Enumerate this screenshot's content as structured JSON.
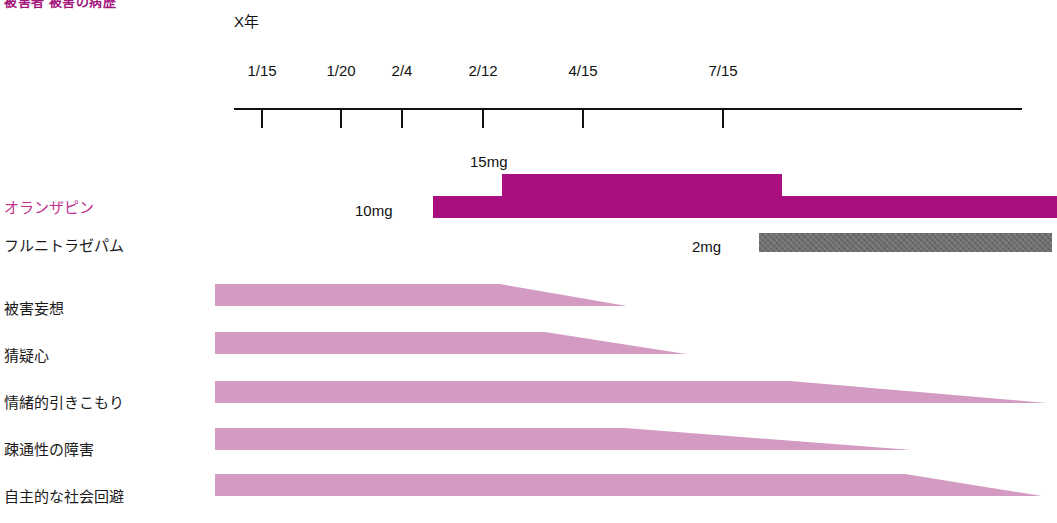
{
  "title": "被害者 被害の病歴",
  "axis": {
    "year_label": "X年",
    "ticks": [
      {
        "label": "1/15",
        "x": 261
      },
      {
        "label": "1/20",
        "x": 340
      },
      {
        "label": "2/4",
        "x": 401
      },
      {
        "label": "2/12",
        "x": 482
      },
      {
        "label": "4/15",
        "x": 582
      },
      {
        "label": "7/15",
        "x": 722
      }
    ],
    "line": {
      "x": 234,
      "y": 108,
      "width": 788
    }
  },
  "medications": [
    {
      "name": "オランザピン",
      "label_color": "#c2328f",
      "bar_color": "#a81080",
      "label_y": 196,
      "segments": [
        {
          "dose": "10mg",
          "dose_x": 355,
          "dose_y": 202,
          "x": 433,
          "width": 624,
          "y": 196,
          "height": 22
        },
        {
          "dose": "15mg",
          "dose_x": 470,
          "dose_y": 153,
          "x": 502,
          "width": 280,
          "y": 174,
          "height": 22
        }
      ]
    },
    {
      "name": "フルニトラゼパム",
      "label_color": "#1a1a1a",
      "bar_color": "#6e6e6e",
      "label_y": 234,
      "segments": [
        {
          "dose": "2mg",
          "dose_x": 692,
          "dose_y": 238,
          "x": 759,
          "width": 293,
          "y": 233,
          "height": 19
        }
      ]
    }
  ],
  "symptoms": [
    {
      "name": "被害妄想",
      "label_y": 297,
      "top": 284,
      "left": 215,
      "full_to": 500,
      "end": 627,
      "thickness": 22
    },
    {
      "name": "猜疑心",
      "label_y": 344,
      "top": 332,
      "left": 215,
      "full_to": 545,
      "end": 686,
      "thickness": 22
    },
    {
      "name": "情緒的引きこもり",
      "label_y": 391,
      "top": 381,
      "left": 215,
      "full_to": 790,
      "end": 1047,
      "thickness": 22
    },
    {
      "name": "疎通性の障害",
      "label_y": 438,
      "top": 428,
      "left": 215,
      "full_to": 625,
      "end": 912,
      "thickness": 22
    },
    {
      "name": "自主的な社会回避",
      "label_y": 485,
      "top": 474,
      "left": 215,
      "full_to": 905,
      "end": 1042,
      "thickness": 22
    }
  ],
  "colors": {
    "magenta": "#a81080",
    "magenta_text": "#c2328f",
    "pink": "#d49bc2",
    "gray": "#6e6e6e",
    "axis": "#111111"
  },
  "chart_data": {
    "type": "bar",
    "title": "被害者 被害の病歴",
    "xlabel": "X年",
    "ylabel": "",
    "x_tick_labels": [
      "1/15",
      "1/20",
      "2/4",
      "2/12",
      "4/15",
      "7/15"
    ],
    "grid": false,
    "legend_position": "none",
    "series": [
      {
        "name": "オランザピン",
        "kind": "dose-timeline",
        "color": "#a81080",
        "values": [
          {
            "dose_mg": 10,
            "dose_label": "10mg",
            "start": "1/15-ish",
            "note": "baseline dose spanning from just before 2/4 to end of chart"
          },
          {
            "dose_mg": 15,
            "dose_label": "15mg",
            "start": "2/12",
            "end": "7/15",
            "note": "raised step from 2/12 through 7/15"
          }
        ]
      },
      {
        "name": "フルニトラゼパム",
        "kind": "dose-timeline",
        "color": "#6e6e6e",
        "values": [
          {
            "dose_mg": 2,
            "dose_label": "2mg",
            "start": "7/15",
            "note": "constant from 7/15 to end of chart"
          }
        ]
      },
      {
        "name": "被害妄想",
        "kind": "severity-taper",
        "color": "#d49bc2",
        "values": [
          {
            "severity_full_until": "~3/10",
            "resolved_at": "~4/25"
          }
        ]
      },
      {
        "name": "猜疑心",
        "kind": "severity-taper",
        "color": "#d49bc2",
        "values": [
          {
            "severity_full_until": "~3/25",
            "resolved_at": "~5/20"
          }
        ]
      },
      {
        "name": "情緒的引きこもり",
        "kind": "severity-taper",
        "color": "#d49bc2",
        "values": [
          {
            "severity_full_until": "~7/15",
            "resolved_at": "end of chart"
          }
        ]
      },
      {
        "name": "疎通性の障害",
        "kind": "severity-taper",
        "color": "#d49bc2",
        "values": [
          {
            "severity_full_until": "~5/5",
            "resolved_at": "~9/10"
          }
        ]
      },
      {
        "name": "自主的な社会回避",
        "kind": "severity-taper",
        "color": "#d49bc2",
        "values": [
          {
            "severity_full_until": "~10/1",
            "resolved_at": "end of chart"
          }
        ]
      }
    ]
  }
}
